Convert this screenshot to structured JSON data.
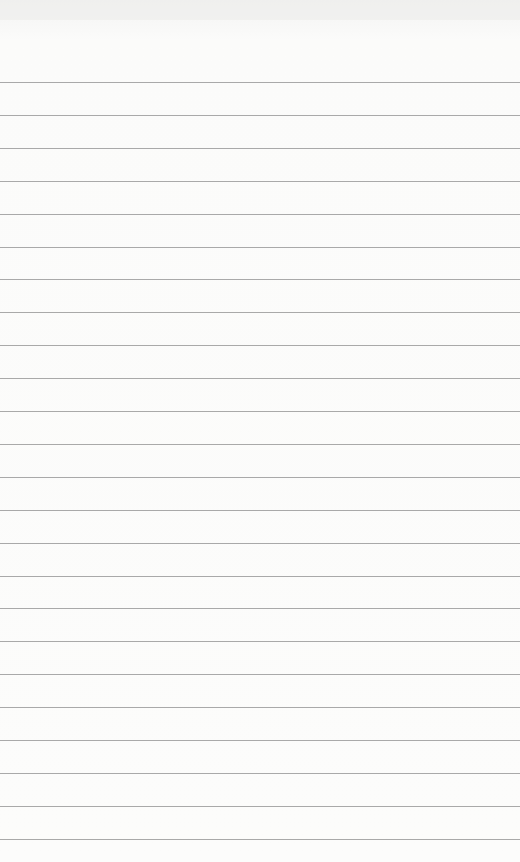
{
  "page": {
    "type": "lined-notepad",
    "background_color": "#fbfbfa",
    "line_color": "#a9a9a9",
    "first_line_y": 82,
    "line_spacing": 32.9,
    "line_count": 24
  }
}
